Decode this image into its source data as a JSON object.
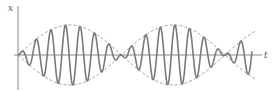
{
  "figure": {
    "title": "",
    "axes": {
      "vertical_label": "x",
      "horizontal_label": "t"
    },
    "colors": {
      "background": "#ffffff",
      "axis": "#8a8a8a",
      "carrier": "#7a7a7a",
      "envelope": "#9a9a9a",
      "label": "#555555"
    },
    "geometry": {
      "origin_x": 18,
      "origin_y": 55,
      "axis_top": 6,
      "axis_bottom": 90,
      "axis_right": 262,
      "envelope_amplitude": 30,
      "envelope_half_period": 103.5,
      "carrier_period": 14.6,
      "wave_end_x": 252,
      "envelope_end_x": 256
    }
  },
  "chart_data": {
    "type": "line",
    "title": "",
    "xlabel": "t",
    "ylabel": "x",
    "series": [
      {
        "name": "carrier x(t)",
        "style": "solid",
        "formula": "x = A·sin(π t / T_env)·sin(2π t / T_c)",
        "envelope_nodes_t_px": [
          0,
          104,
          207
        ],
        "oscillations_per_lobe": 7
      },
      {
        "name": "envelope +A·sin(π t / T_env)",
        "style": "dashed"
      },
      {
        "name": "envelope -A·sin(π t / T_env)",
        "style": "dashed"
      }
    ],
    "grid": false,
    "legend": "none"
  }
}
